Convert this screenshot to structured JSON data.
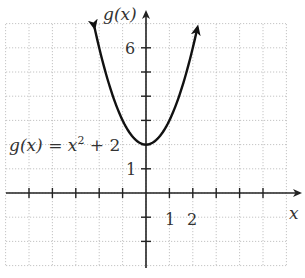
{
  "chart_data": {
    "type": "line",
    "title": "",
    "function_label": "g(x) = x² + 2",
    "function_label_parts": {
      "lhs": "g(x) = x",
      "exp": "2",
      "rhs": " + 2"
    },
    "xlabel": "x",
    "ylabel": "g(x)",
    "xlim": [
      -6,
      6
    ],
    "ylim": [
      -3,
      7
    ],
    "grid": true,
    "x_tick_labels": [
      {
        "value": 1,
        "label": "1"
      },
      {
        "value": 2,
        "label": "2"
      }
    ],
    "y_tick_labels": [
      {
        "value": 1,
        "label": "1"
      },
      {
        "value": 6,
        "label": "6"
      }
    ],
    "x_ticks": [
      -5,
      -4,
      -3,
      -2,
      -1,
      1,
      2,
      3,
      4,
      5
    ],
    "y_ticks": [
      -2,
      -1,
      1,
      2,
      3,
      4,
      5,
      6
    ],
    "series": [
      {
        "name": "g(x) = x^2 + 2",
        "expression": "x^2 + 2",
        "domain_shown": [
          -2.2,
          2.2
        ],
        "arrows_at_ends": true,
        "vertex": [
          0,
          2
        ],
        "x": [
          -2.2,
          -2,
          -1.5,
          -1,
          -0.5,
          0,
          0.5,
          1,
          1.5,
          2,
          2.2
        ],
        "values": [
          6.84,
          6,
          4.25,
          3,
          2.25,
          2,
          2.25,
          3,
          4.25,
          6,
          6.84
        ]
      }
    ]
  },
  "layout": {
    "origin_px": [
      146,
      193
    ],
    "unit_px": [
      23.4,
      24.2
    ],
    "grid_px": {
      "left": 6,
      "right": 286,
      "top": 24,
      "bottom": 266
    },
    "colors": {
      "curve": "#111111",
      "axis": "#222222",
      "grid": "#b5b5b5",
      "text": "#333333"
    }
  }
}
